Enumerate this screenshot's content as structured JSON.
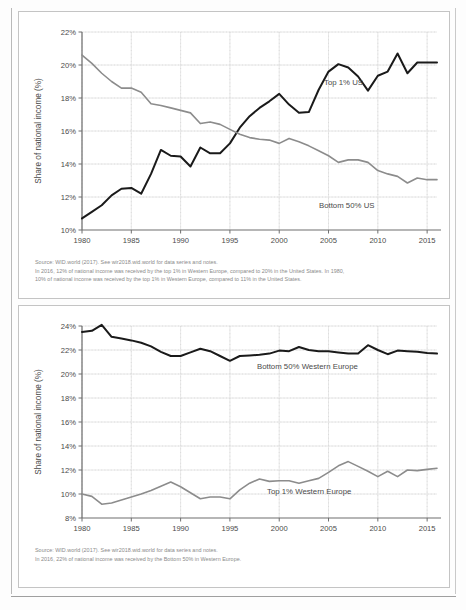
{
  "page": {
    "background": "#fdfdfd",
    "border_color": "#c4c4c4"
  },
  "colors": {
    "dark_series": "#1a1a1a",
    "gray_series": "#8c8c8c",
    "axis": "#6f6f6f",
    "grid": "#e2e2e2",
    "grid_dotted": "#d6d6d6",
    "text": "#4a4a4a",
    "caption_text": "#8a8a8a"
  },
  "chart_top": {
    "ylabel": "Share of national income (%)",
    "series_label_top1": "Top 1% US",
    "series_label_bottom50": "Bottom 50% US",
    "ytick_labels": [
      "10%",
      "12%",
      "14%",
      "16%",
      "18%",
      "20%",
      "22%"
    ],
    "xtick_labels": [
      "1980",
      "1985",
      "1990",
      "1995",
      "2000",
      "2005",
      "2010",
      "2015"
    ],
    "caption_line1": "Source:  WID.world (2017). See wir2018.wid.world for data series and notes.",
    "caption_line2": "In 2016, 12% of national income was received by the top 1% in Western Europe, compared to 20% in the United States. In 1980,",
    "caption_line3": "10% of national income was received by the top 1% in Western Europe, compared to 11% in the United States."
  },
  "chart_bottom": {
    "ylabel": "Share of national income (%)",
    "series_label_bottom50": "Bottom 50% Western Europe",
    "series_label_top1": "Top 1% Western Europe",
    "ytick_labels": [
      "8%",
      "10%",
      "12%",
      "14%",
      "16%",
      "18%",
      "20%",
      "22%",
      "24%"
    ],
    "xtick_labels": [
      "1980",
      "1985",
      "1990",
      "1995",
      "2000",
      "2005",
      "2010",
      "2015"
    ],
    "caption_line1": "Source:  WID.world (2017). See wir2018.wid.world for data series and notes.",
    "caption_line2": "In 2016, 22% of national income was received by the Bottom 50% in Western Europe."
  },
  "chart_data": [
    {
      "id": "us-income-shares",
      "type": "line",
      "title": "",
      "xlabel": "",
      "ylabel": "Share of national income (%)",
      "xlim": [
        1980,
        2016
      ],
      "ylim": [
        10,
        22
      ],
      "ytick_values": [
        10,
        12,
        14,
        16,
        18,
        20,
        22
      ],
      "xtick_values": [
        1980,
        1985,
        1990,
        1995,
        2000,
        2005,
        2010,
        2015
      ],
      "grid": true,
      "legend": "inline-annotation",
      "x": [
        1980,
        1981,
        1982,
        1983,
        1984,
        1985,
        1986,
        1987,
        1988,
        1989,
        1990,
        1991,
        1992,
        1993,
        1994,
        1995,
        1996,
        1997,
        1998,
        1999,
        2000,
        2001,
        2002,
        2003,
        2004,
        2005,
        2006,
        2007,
        2008,
        2009,
        2010,
        2011,
        2012,
        2013,
        2014,
        2015,
        2016
      ],
      "series": [
        {
          "name": "Top 1% US",
          "color": "#1a1a1a",
          "values": [
            10.7,
            11.1,
            11.5,
            12.1,
            12.5,
            12.55,
            12.2,
            13.4,
            14.85,
            14.5,
            14.45,
            13.85,
            15.0,
            14.65,
            14.65,
            15.25,
            16.2,
            16.9,
            17.4,
            17.8,
            18.25,
            17.6,
            17.1,
            17.15,
            18.5,
            19.6,
            20.05,
            19.85,
            19.3,
            18.45,
            19.35,
            19.6,
            20.7,
            19.5,
            20.15,
            20.15,
            20.15
          ]
        },
        {
          "name": "Bottom 50% US",
          "color": "#8c8c8c",
          "values": [
            20.6,
            20.1,
            19.5,
            19.0,
            18.6,
            18.6,
            18.35,
            17.65,
            17.55,
            17.4,
            17.25,
            17.1,
            16.45,
            16.55,
            16.4,
            16.1,
            15.8,
            15.6,
            15.5,
            15.45,
            15.25,
            15.55,
            15.35,
            15.1,
            14.8,
            14.5,
            14.1,
            14.25,
            14.25,
            14.1,
            13.6,
            13.4,
            13.25,
            12.85,
            13.15,
            13.05,
            13.05
          ]
        }
      ]
    },
    {
      "id": "western-europe-income-shares",
      "type": "line",
      "title": "",
      "xlabel": "",
      "ylabel": "Share of national income (%)",
      "xlim": [
        1980,
        2016
      ],
      "ylim": [
        8,
        24
      ],
      "ytick_values": [
        8,
        10,
        12,
        14,
        16,
        18,
        20,
        22,
        24
      ],
      "xtick_values": [
        1980,
        1985,
        1990,
        1995,
        2000,
        2005,
        2010,
        2015
      ],
      "grid": true,
      "legend": "inline-annotation",
      "x": [
        1980,
        1981,
        1982,
        1983,
        1984,
        1985,
        1986,
        1987,
        1988,
        1989,
        1990,
        1991,
        1992,
        1993,
        1994,
        1995,
        1996,
        1997,
        1998,
        1999,
        2000,
        2001,
        2002,
        2003,
        2004,
        2005,
        2006,
        2007,
        2008,
        2009,
        2010,
        2011,
        2012,
        2013,
        2014,
        2015,
        2016
      ],
      "series": [
        {
          "name": "Bottom 50% Western Europe",
          "color": "#1a1a1a",
          "values": [
            23.5,
            23.6,
            24.1,
            23.1,
            22.95,
            22.8,
            22.6,
            22.3,
            21.85,
            21.5,
            21.5,
            21.8,
            22.1,
            21.9,
            21.5,
            21.1,
            21.5,
            21.55,
            21.6,
            21.7,
            21.95,
            21.9,
            22.25,
            22.0,
            21.9,
            21.9,
            21.8,
            21.7,
            21.7,
            22.4,
            22.0,
            21.65,
            21.95,
            21.9,
            21.85,
            21.75,
            21.7
          ]
        },
        {
          "name": "Top 1% Western Europe",
          "color": "#8c8c8c",
          "values": [
            10.0,
            9.8,
            9.15,
            9.25,
            9.5,
            9.75,
            10.0,
            10.3,
            10.65,
            11.0,
            10.6,
            10.1,
            9.6,
            9.75,
            9.75,
            9.6,
            10.35,
            10.9,
            11.25,
            11.05,
            11.1,
            11.1,
            10.9,
            11.1,
            11.3,
            11.8,
            12.35,
            12.7,
            12.3,
            11.9,
            11.45,
            11.9,
            11.45,
            12.0,
            11.95,
            12.05,
            12.15
          ]
        }
      ]
    }
  ]
}
